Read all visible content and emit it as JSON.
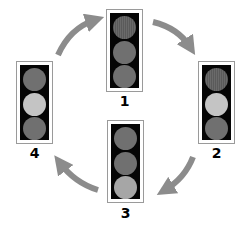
{
  "diagram": {
    "colors": {
      "arrow": "#8c8c8c",
      "housing": "#050505",
      "lamp_off": "#707070",
      "lamp_on": "#c4c4c4"
    },
    "lights": [
      {
        "label": "1",
        "lamps": [
          "on-red",
          "off",
          "off"
        ]
      },
      {
        "label": "2",
        "lamps": [
          "on-red",
          "on-amber",
          "off"
        ]
      },
      {
        "label": "3",
        "lamps": [
          "off",
          "off",
          "on-green"
        ]
      },
      {
        "label": "4",
        "lamps": [
          "off",
          "on-amber",
          "off"
        ]
      }
    ],
    "arrows": [
      {
        "from": "4",
        "to": "1"
      },
      {
        "from": "1",
        "to": "2"
      },
      {
        "from": "2",
        "to": "3"
      },
      {
        "from": "3",
        "to": "4"
      }
    ]
  }
}
